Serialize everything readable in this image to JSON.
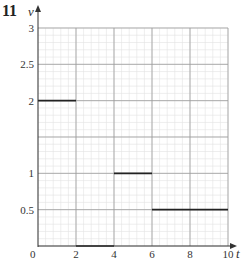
{
  "question_number": "11",
  "chart_data": {
    "type": "line",
    "title": "",
    "xlabel": "t",
    "ylabel": "v",
    "xlim": [
      0,
      10
    ],
    "ylim": [
      0,
      3
    ],
    "grid": true,
    "x_ticks": [
      "2",
      "4",
      "6",
      "8",
      "10"
    ],
    "y_ticks": [
      "0.5",
      "1",
      "2",
      "2.5",
      "3"
    ],
    "origin_label": "0",
    "series": [
      {
        "name": "segment-1",
        "x": [
          0,
          2
        ],
        "y": [
          2,
          2
        ]
      },
      {
        "name": "segment-2",
        "x": [
          2,
          4
        ],
        "y": [
          0,
          0
        ]
      },
      {
        "name": "segment-3",
        "x": [
          4,
          6
        ],
        "y": [
          1,
          1
        ]
      },
      {
        "name": "segment-4",
        "x": [
          6,
          10
        ],
        "y": [
          0.5,
          0.5
        ]
      }
    ]
  },
  "colors": {
    "major_grid": "#9a9a9a",
    "minor_grid": "#e2e2e2",
    "axis": "#333333",
    "line": "#222222"
  }
}
